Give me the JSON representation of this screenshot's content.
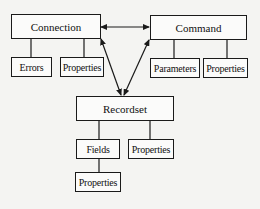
{
  "diagram": {
    "nodes": {
      "connection": {
        "label": "Connection"
      },
      "connection_errors": {
        "label": "Errors"
      },
      "connection_properties": {
        "label": "Properties"
      },
      "command": {
        "label": "Command"
      },
      "command_parameters": {
        "label": "Parameters"
      },
      "command_properties": {
        "label": "Properties"
      },
      "recordset": {
        "label": "Recordset"
      },
      "recordset_fields": {
        "label": "Fields"
      },
      "recordset_properties": {
        "label": "Properties"
      },
      "fields_properties": {
        "label": "Properties"
      }
    },
    "edges": [
      {
        "from": "connection",
        "to": "command",
        "type": "bidirectional-arrow"
      },
      {
        "from": "connection",
        "to": "recordset",
        "type": "bidirectional-arrow"
      },
      {
        "from": "command",
        "to": "recordset",
        "type": "bidirectional-arrow"
      },
      {
        "from": "connection",
        "to": "connection_errors",
        "type": "line"
      },
      {
        "from": "connection",
        "to": "connection_properties",
        "type": "line"
      },
      {
        "from": "command",
        "to": "command_parameters",
        "type": "line"
      },
      {
        "from": "command",
        "to": "command_properties",
        "type": "line"
      },
      {
        "from": "recordset",
        "to": "recordset_fields",
        "type": "line"
      },
      {
        "from": "recordset",
        "to": "recordset_properties",
        "type": "line"
      },
      {
        "from": "recordset_fields",
        "to": "fields_properties",
        "type": "line"
      }
    ]
  }
}
